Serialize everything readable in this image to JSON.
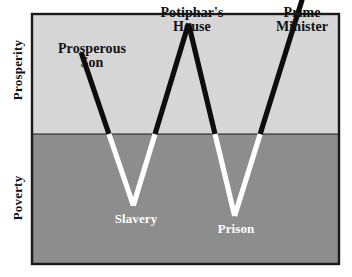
{
  "chart_data": {
    "type": "line",
    "title": "",
    "subtitle": "",
    "xlabel": "",
    "ylabel": "Prosperity / Poverty",
    "grid": false,
    "legend": null,
    "axis_labels": {
      "upper_region": "Prosperity",
      "lower_region": "Poverty"
    },
    "baseline_y": 0,
    "ylim": [
      -100,
      100
    ],
    "xlim": [
      0,
      100
    ],
    "regions": [
      {
        "name": "Prosperity",
        "color": "#d6d6d6",
        "from": 0,
        "to": 100
      },
      {
        "name": "Poverty",
        "color": "#8d8d8d",
        "from": -100,
        "to": 0
      }
    ],
    "points": [
      {
        "label": "Prosperous Son",
        "x": 16,
        "y": 68,
        "phase": "prosperity"
      },
      {
        "label": "Slavery",
        "x": 33,
        "y": -55,
        "phase": "poverty"
      },
      {
        "label": "Potiphar's House",
        "x": 51,
        "y": 92,
        "phase": "prosperity"
      },
      {
        "label": "Prison",
        "x": 66,
        "y": -63,
        "phase": "poverty"
      },
      {
        "label": "Prime Minister",
        "x": 88,
        "y": 112,
        "phase": "prosperity"
      }
    ],
    "series": [
      {
        "name": "Joseph's life",
        "values": [
          68,
          -55,
          92,
          -63,
          112
        ],
        "segment_colors_above_baseline": "#0d0d0d",
        "segment_colors_below_baseline": "#ffffff"
      }
    ],
    "colors": {
      "prosperity_band": "#d6d6d6",
      "poverty_band": "#8d8d8d",
      "line_above": "#0d0d0d",
      "line_below": "#ffffff",
      "frame": "#1a1a1a",
      "label_dark": "#111111",
      "label_light": "#ffffff"
    }
  },
  "chart": {
    "peak_labels": [
      {
        "id": "prosperous-son",
        "text": "Prosperous\nSon"
      },
      {
        "id": "potiphars-house",
        "text": "Potiphar's\nHouse"
      },
      {
        "id": "prime-minister",
        "text": "Prime\nMinister"
      }
    ],
    "trough_labels": [
      {
        "id": "slavery",
        "text": "Slavery"
      },
      {
        "id": "prison",
        "text": "Prison"
      }
    ],
    "axis": {
      "prosperity": "Prosperity",
      "poverty": "Poverty"
    }
  }
}
